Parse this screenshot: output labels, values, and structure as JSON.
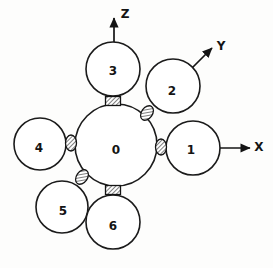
{
  "figure": {
    "background_color": "#fdfdfc",
    "line_color": "#141414",
    "fill_color": "#ffffff"
  },
  "axes": [
    {
      "name": "z-axis",
      "label": "Z",
      "x1": 114,
      "y1": 70,
      "x2": 114,
      "y2": 18,
      "label_x": 125,
      "label_y": 14
    },
    {
      "name": "y-axis",
      "label": "Y",
      "x1": 178,
      "y1": 82,
      "x2": 212,
      "y2": 48,
      "label_x": 221,
      "label_y": 46
    },
    {
      "name": "x-axis",
      "label": "X",
      "x1": 205,
      "y1": 148,
      "x2": 250,
      "y2": 148,
      "label_x": 259,
      "label_y": 147
    }
  ],
  "spheres": [
    {
      "name": "sphere-0",
      "label": "0",
      "cx": 116,
      "cy": 145,
      "r": 41,
      "label_x": 116,
      "label_y": 150
    },
    {
      "name": "sphere-1",
      "label": "1",
      "cx": 193,
      "cy": 148,
      "r": 27,
      "label_x": 191,
      "label_y": 150
    },
    {
      "name": "sphere-2",
      "label": "2",
      "cx": 173,
      "cy": 86,
      "r": 27,
      "label_x": 172,
      "label_y": 91
    },
    {
      "name": "sphere-3",
      "label": "3",
      "cx": 113,
      "cy": 69,
      "r": 27,
      "label_x": 113,
      "label_y": 71
    },
    {
      "name": "sphere-4",
      "label": "4",
      "cx": 40,
      "cy": 144,
      "r": 26,
      "label_x": 39,
      "label_y": 148
    },
    {
      "name": "sphere-5",
      "label": "5",
      "cx": 62,
      "cy": 207,
      "r": 26,
      "label_x": 63,
      "label_y": 211
    },
    {
      "name": "sphere-6",
      "label": "6",
      "cx": 113,
      "cy": 222,
      "r": 27,
      "label_x": 113,
      "label_y": 226
    }
  ],
  "bonds": [
    {
      "name": "bond-0-3",
      "from": "0",
      "to": "3",
      "shape": "rect",
      "cx": 113,
      "cy": 101,
      "w": 15,
      "h": 9,
      "rotation": 0
    },
    {
      "name": "bond-0-6",
      "from": "0",
      "to": "6",
      "shape": "rect",
      "cx": 113,
      "cy": 190,
      "w": 15,
      "h": 9,
      "rotation": 0
    },
    {
      "name": "bond-0-1",
      "from": "0",
      "to": "1",
      "shape": "ellipse",
      "cx": 161,
      "cy": 147,
      "rx": 5.5,
      "ry": 8,
      "rotation": 0
    },
    {
      "name": "bond-0-4",
      "from": "0",
      "to": "4",
      "shape": "ellipse",
      "cx": 71,
      "cy": 143,
      "rx": 5.5,
      "ry": 8,
      "rotation": 0
    },
    {
      "name": "bond-0-2",
      "from": "0",
      "to": "2",
      "shape": "ellipse",
      "cx": 147,
      "cy": 113,
      "rx": 5.5,
      "ry": 8,
      "rotation": 35
    },
    {
      "name": "bond-0-5",
      "from": "0",
      "to": "5",
      "shape": "ellipse",
      "cx": 82,
      "cy": 177,
      "rx": 5.5,
      "ry": 8,
      "rotation": 35
    }
  ]
}
